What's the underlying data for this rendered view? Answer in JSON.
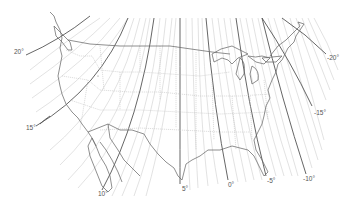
{
  "map": {
    "subject": "Isogonic lines of magnetic declination over the contiguous United States",
    "colors": {
      "major_line": "#555555",
      "minor_line": "#c8c8c8",
      "coastline": "#6a6a6a",
      "state_border": "#bdbdbd",
      "label": "#555555",
      "background": "#ffffff"
    },
    "labels": [
      {
        "text": "20°",
        "x": 14,
        "y": 52
      },
      {
        "text": "15°",
        "x": 26,
        "y": 128
      },
      {
        "text": "10°",
        "x": 99,
        "y": 194
      },
      {
        "text": "5°",
        "x": 182,
        "y": 187
      },
      {
        "text": "0°",
        "x": 229,
        "y": 183
      },
      {
        "text": "-5°",
        "x": 267,
        "y": 179
      },
      {
        "text": "-10°",
        "x": 304,
        "y": 177
      },
      {
        "text": "-15°",
        "x": 313,
        "y": 109
      },
      {
        "text": "-20°",
        "x": 327,
        "y": 56
      }
    ]
  }
}
